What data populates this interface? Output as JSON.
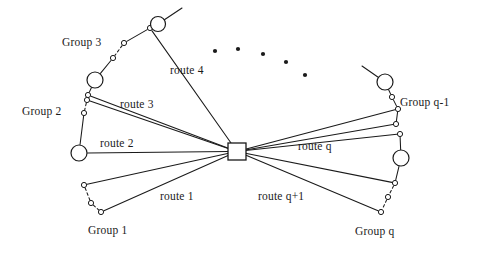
{
  "figure": {
    "kind": "hub-and-spoke routing network diagram",
    "background_color": "#ffffff",
    "stroke_color": "#1a1a1a",
    "node_fill_color": "#ffffff",
    "width": 485,
    "height": 255
  },
  "depot": {
    "label": "",
    "shape": "square",
    "x": 228,
    "y": 143,
    "w": 18,
    "h": 17
  },
  "group_labels": [
    {
      "id": "group-3",
      "text": "Group 3",
      "x": 62,
      "y": 36
    },
    {
      "id": "group-2",
      "text": "Group 2",
      "x": 22,
      "y": 105
    },
    {
      "id": "group-1",
      "text": "Group 1",
      "x": 88,
      "y": 224
    },
    {
      "id": "group-q",
      "text": "Group q",
      "x": 355,
      "y": 225
    },
    {
      "id": "group-q-1",
      "text": "Group q-1",
      "x": 400,
      "y": 96
    }
  ],
  "route_labels": [
    {
      "id": "route-4",
      "text": "route 4",
      "x": 170,
      "y": 64
    },
    {
      "id": "route-3",
      "text": "route 3",
      "x": 120,
      "y": 98
    },
    {
      "id": "route-2",
      "text": "route 2",
      "x": 100,
      "y": 137
    },
    {
      "id": "route-1",
      "text": "route 1",
      "x": 160,
      "y": 190
    },
    {
      "id": "route-q",
      "text": "route q",
      "x": 298,
      "y": 140
    },
    {
      "id": "route-q-1",
      "text": "route q+1",
      "x": 258,
      "y": 190
    }
  ],
  "ellipsis_dots": [
    {
      "x": 215,
      "y": 51
    },
    {
      "x": 238,
      "y": 49
    },
    {
      "x": 263,
      "y": 54
    },
    {
      "x": 286,
      "y": 62
    },
    {
      "x": 305,
      "y": 75
    }
  ],
  "groups": [
    {
      "id": "group-1",
      "name": "Group 1",
      "nodes": [
        {
          "type": "small",
          "x": 84,
          "y": 185,
          "r": 2.6
        },
        {
          "type": "small",
          "x": 91,
          "y": 203,
          "r": 2.6
        },
        {
          "type": "small",
          "x": 101,
          "y": 212,
          "r": 2.6
        }
      ],
      "intra_links": [
        {
          "from": 0,
          "to": 1,
          "style": "dashed"
        },
        {
          "from": 1,
          "to": 2,
          "style": "dashed"
        }
      ],
      "spokes": [
        {
          "node": 0,
          "style": "solid"
        },
        {
          "node": 2,
          "style": "solid"
        }
      ]
    },
    {
      "id": "group-2",
      "name": "Group 2",
      "nodes": [
        {
          "type": "small",
          "x": 87,
          "y": 100,
          "r": 2.6
        },
        {
          "type": "small",
          "x": 84,
          "y": 113,
          "r": 2.6
        },
        {
          "type": "large",
          "x": 79,
          "y": 153,
          "r": 8.0
        }
      ],
      "intra_links": [
        {
          "from": 0,
          "to": 1,
          "style": "dashed"
        },
        {
          "from": 1,
          "to": 2,
          "style": "solid"
        }
      ],
      "spokes": [
        {
          "node": 0,
          "style": "solid"
        },
        {
          "node": 2,
          "style": "solid"
        }
      ]
    },
    {
      "id": "group-3",
      "name": "Group 3",
      "nodes": [
        {
          "type": "small",
          "x": 150,
          "y": 28,
          "r": 2.6
        },
        {
          "type": "large",
          "x": 158,
          "y": 24,
          "r": 7.5
        },
        {
          "type": "small",
          "x": 124,
          "y": 43,
          "r": 2.6
        },
        {
          "type": "small",
          "x": 113,
          "y": 58,
          "r": 2.6
        },
        {
          "type": "large",
          "x": 95,
          "y": 80,
          "r": 8.0
        },
        {
          "type": "small",
          "x": 88,
          "y": 95,
          "r": 2.6
        }
      ],
      "intra_links": [
        {
          "from": 0,
          "to": 1,
          "style": "solid"
        },
        {
          "from": 0,
          "to": 2,
          "style": "solid"
        },
        {
          "from": 2,
          "to": 3,
          "style": "dashed"
        },
        {
          "from": 3,
          "to": 4,
          "style": "solid"
        },
        {
          "from": 4,
          "to": 5,
          "style": "solid"
        }
      ],
      "spokes": [
        {
          "node": 0,
          "style": "solid"
        },
        {
          "node": 5,
          "style": "solid"
        }
      ]
    },
    {
      "id": "group-q-1",
      "name": "Group q-1",
      "nodes": [
        {
          "type": "large",
          "x": 385,
          "y": 82,
          "r": 8.0
        },
        {
          "type": "small",
          "x": 392,
          "y": 97,
          "r": 2.6
        },
        {
          "type": "small",
          "x": 398,
          "y": 109,
          "r": 2.6
        },
        {
          "type": "small",
          "x": 396,
          "y": 124,
          "r": 2.6
        }
      ],
      "intra_links": [
        {
          "from": 0,
          "to": 1,
          "style": "solid"
        },
        {
          "from": 1,
          "to": 2,
          "style": "solid"
        },
        {
          "from": 2,
          "to": 3,
          "style": "solid"
        }
      ],
      "spokes": [
        {
          "node": 2,
          "style": "solid"
        },
        {
          "node": 3,
          "style": "solid"
        }
      ]
    },
    {
      "id": "group-q",
      "name": "Group q",
      "nodes": [
        {
          "type": "small",
          "x": 400,
          "y": 134,
          "r": 2.6
        },
        {
          "type": "large",
          "x": 401,
          "y": 158,
          "r": 8.0
        },
        {
          "type": "small",
          "x": 395,
          "y": 183,
          "r": 2.6
        },
        {
          "type": "small",
          "x": 388,
          "y": 197,
          "r": 2.6
        },
        {
          "type": "small",
          "x": 381,
          "y": 212,
          "r": 2.6
        }
      ],
      "intra_links": [
        {
          "from": 0,
          "to": 1,
          "style": "solid"
        },
        {
          "from": 1,
          "to": 2,
          "style": "solid"
        },
        {
          "from": 2,
          "to": 3,
          "style": "dashed"
        },
        {
          "from": 3,
          "to": 4,
          "style": "dashed"
        }
      ],
      "spokes": [
        {
          "node": 0,
          "style": "solid"
        },
        {
          "node": 2,
          "style": "solid"
        },
        {
          "node": 4,
          "style": "solid"
        }
      ]
    }
  ],
  "extra_spokes": [
    {
      "id": "spoke-top-left-outer",
      "x": 150,
      "y": 28
    },
    {
      "id": "spoke-right-outer",
      "x": 385,
      "y": 82
    }
  ],
  "free_edges": [
    {
      "id": "edge-top-left-tail",
      "x1": 158,
      "y1": 24,
      "x2": 182,
      "y2": 8
    },
    {
      "id": "edge-top-right-tail",
      "x1": 385,
      "y1": 82,
      "x2": 362,
      "y2": 66
    }
  ]
}
